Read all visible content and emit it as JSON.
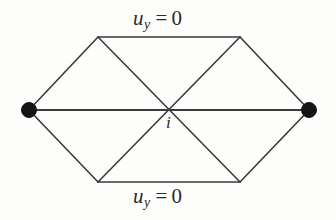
{
  "figure": {
    "name": "triangular-finite-element-mesh-hexagon",
    "background_color": "#fdfdfc",
    "line_color": "#3a3a3a",
    "node_color": "#141414"
  },
  "labels": {
    "top_boundary": {
      "variable": "u",
      "subscript": "y",
      "relation": "=",
      "value": "0",
      "full_text": "u_y = 0"
    },
    "bottom_boundary": {
      "variable": "u",
      "subscript": "y",
      "relation": "=",
      "value": "0",
      "full_text": "u_y = 0"
    },
    "center_node": "i"
  },
  "geometry": {
    "width": 336,
    "height": 220,
    "vertices": [
      {
        "name": "left-node",
        "x": 29,
        "y": 110,
        "marker": "filled-dot",
        "radius": 7
      },
      {
        "name": "top-left-node",
        "x": 98,
        "y": 37,
        "marker": "none"
      },
      {
        "name": "top-right-node",
        "x": 240,
        "y": 37,
        "marker": "none"
      },
      {
        "name": "right-node",
        "x": 309,
        "y": 110,
        "marker": "filled-dot",
        "radius": 7
      },
      {
        "name": "bottom-right-node",
        "x": 240,
        "y": 182,
        "marker": "none"
      },
      {
        "name": "bottom-left-node",
        "x": 98,
        "y": 182,
        "marker": "none"
      },
      {
        "name": "center-node",
        "x": 169,
        "y": 110,
        "marker": "none"
      }
    ],
    "edges": [
      {
        "name": "edge-left-to-topleft",
        "x1": 29,
        "y1": 110,
        "x2": 98,
        "y2": 37
      },
      {
        "name": "edge-top",
        "x1": 98,
        "y1": 37,
        "x2": 240,
        "y2": 37
      },
      {
        "name": "edge-topright-to-right",
        "x1": 240,
        "y1": 37,
        "x2": 309,
        "y2": 110
      },
      {
        "name": "edge-right-to-bottomright",
        "x1": 309,
        "y1": 110,
        "x2": 240,
        "y2": 182
      },
      {
        "name": "edge-bottom",
        "x1": 240,
        "y1": 182,
        "x2": 98,
        "y2": 182
      },
      {
        "name": "edge-bottomleft-to-left",
        "x1": 98,
        "y1": 182,
        "x2": 29,
        "y2": 110
      },
      {
        "name": "edge-diagonal-horizontal",
        "x1": 29,
        "y1": 110,
        "x2": 309,
        "y2": 110
      },
      {
        "name": "edge-diagonal-tl-br",
        "x1": 98,
        "y1": 37,
        "x2": 240,
        "y2": 182
      },
      {
        "name": "edge-diagonal-tr-bl",
        "x1": 240,
        "y1": 37,
        "x2": 98,
        "y2": 182
      }
    ]
  }
}
